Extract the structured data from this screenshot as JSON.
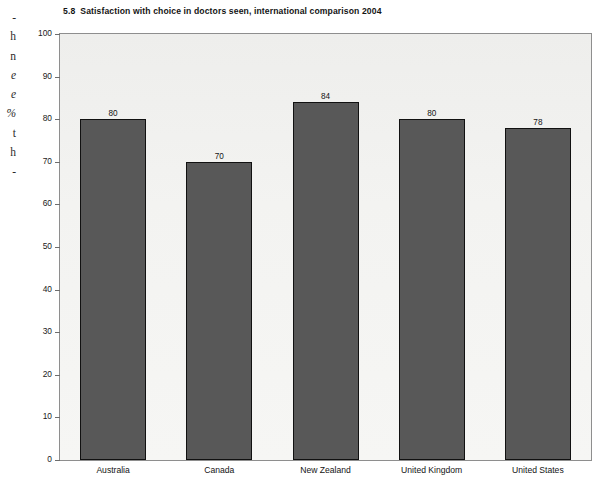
{
  "page_edge_text": {
    "lines": [
      {
        "text": "-",
        "italic": false
      },
      {
        "text": "h",
        "italic": false
      },
      {
        "text": "n",
        "italic": false
      },
      {
        "text": "e",
        "italic": true
      },
      {
        "text": "e",
        "italic": true
      },
      {
        "text": "%",
        "italic": true
      },
      {
        "text": "t",
        "italic": false
      },
      {
        "text": "h",
        "italic": false
      },
      {
        "text": "-",
        "italic": false
      }
    ]
  },
  "figure": {
    "number": "5.8",
    "title": "Satisfaction with choice in doctors seen, international comparison 2004"
  },
  "chart_data": {
    "type": "bar",
    "categories": [
      "Australia",
      "Canada",
      "New Zealand",
      "United Kingdom",
      "United States"
    ],
    "values": [
      80,
      70,
      84,
      80,
      78
    ],
    "xlabel": "",
    "ylabel": "% respondents",
    "ylim": [
      0,
      100
    ],
    "yticks": [
      0,
      10,
      20,
      30,
      40,
      50,
      60,
      70,
      80,
      90,
      100
    ],
    "grid": false,
    "legend": false,
    "bar_color": "#585858",
    "bar_edge_color": "#111111",
    "plot_background": "#f2f2f0",
    "data_labels": [
      "80",
      "70",
      "84",
      "80",
      "78"
    ]
  }
}
